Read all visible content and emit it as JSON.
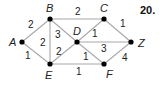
{
  "problem_number": "20.",
  "graph": {
    "nodes": [
      {
        "id": "A",
        "x": 22,
        "y": 42,
        "lx": 9,
        "ly": 46
      },
      {
        "id": "B",
        "x": 50,
        "y": 19,
        "lx": 46,
        "ly": 12
      },
      {
        "id": "C",
        "x": 104,
        "y": 19,
        "lx": 100,
        "ly": 12
      },
      {
        "id": "D",
        "x": 77,
        "y": 42,
        "lx": 73,
        "ly": 35
      },
      {
        "id": "Z",
        "x": 131,
        "y": 42,
        "lx": 138,
        "ly": 47
      },
      {
        "id": "E",
        "x": 50,
        "y": 64,
        "lx": 45,
        "ly": 79
      },
      {
        "id": "F",
        "x": 104,
        "y": 64,
        "lx": 106,
        "ly": 78
      }
    ],
    "edges": [
      {
        "from": "A",
        "to": "B",
        "weight": "2",
        "wx": 28,
        "wy": 28
      },
      {
        "from": "A",
        "to": "E",
        "weight": "1",
        "wx": 25,
        "wy": 59
      },
      {
        "from": "B",
        "to": "C",
        "weight": "2",
        "wx": 75,
        "wy": 15
      },
      {
        "from": "B",
        "to": "E",
        "weight": "2",
        "wx": 40,
        "wy": 46
      },
      {
        "from": "B",
        "to": "D",
        "weight": "3",
        "wx": 55,
        "wy": 38
      },
      {
        "from": "E",
        "to": "D",
        "weight": "2",
        "wx": 56,
        "wy": 55
      },
      {
        "from": "E",
        "to": "F",
        "weight": "1",
        "wx": 76,
        "wy": 75
      },
      {
        "from": "D",
        "to": "C",
        "weight": "1",
        "wx": 92,
        "wy": 37
      },
      {
        "from": "D",
        "to": "Z",
        "weight": "3",
        "wx": 101,
        "wy": 52
      },
      {
        "from": "D",
        "to": "F",
        "weight": "1",
        "wx": 83,
        "wy": 60
      },
      {
        "from": "C",
        "to": "Z",
        "weight": "1",
        "wx": 120,
        "wy": 27
      },
      {
        "from": "F",
        "to": "Z",
        "weight": "4",
        "wx": 122,
        "wy": 61
      }
    ]
  }
}
